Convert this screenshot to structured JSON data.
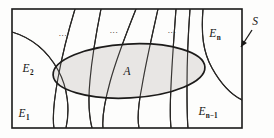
{
  "figure": {
    "caption_alt": "Partition of sample space S into events E1, E2, ..., En-1, En with event A shown as a shaded ellipse overlapping several partition cells",
    "colors": {
      "background": "#fdfdfc",
      "stroke": "#1a1918",
      "ellipse_fill": "#e5e3e1",
      "ellipse_stroke": "#1c1b1a",
      "label_color": "#161514"
    },
    "frame": {
      "x": 12,
      "y": 9,
      "width": 230,
      "height": 119,
      "stroke_width": 1.6
    },
    "ellipse": {
      "cx": 129,
      "cy": 71,
      "rx": 76,
      "ry": 27,
      "rotation_deg": -3,
      "stroke_width": 1.7
    },
    "labels": [
      {
        "id": "label-A",
        "base": "A",
        "sub": "",
        "x": 127,
        "y": 75,
        "size": 11.5
      },
      {
        "id": "label-E1",
        "base": "E",
        "sub": "1",
        "x": 24,
        "y": 117,
        "size": 11.5
      },
      {
        "id": "label-E2",
        "base": "E",
        "sub": "2",
        "x": 28,
        "y": 72,
        "size": 11.5
      },
      {
        "id": "label-En",
        "base": "E",
        "sub": "n",
        "x": 215,
        "y": 37,
        "size": 11.5
      },
      {
        "id": "label-Enm1",
        "base": "E",
        "sub": "n−1",
        "x": 208,
        "y": 115,
        "size": 11.5
      },
      {
        "id": "label-S",
        "base": "S",
        "sub": "",
        "x": 255,
        "y": 25,
        "size": 11.5
      }
    ],
    "ellipses_text": [
      {
        "id": "ellipsis-left",
        "text": "...",
        "x": 63,
        "y": 36,
        "size": 9
      },
      {
        "id": "ellipsis-center",
        "text": "...",
        "x": 114,
        "y": 33,
        "size": 9
      },
      {
        "id": "ellipsis-right",
        "text": "...",
        "x": 172,
        "y": 33,
        "size": 9
      }
    ],
    "pointer": {
      "id": "pointer-S",
      "from_x": 252,
      "from_y": 30,
      "to_x": 241,
      "to_y": 47,
      "stroke_width": 1.3
    },
    "partition_curves": [
      {
        "id": "curve-1",
        "d": "M 12,32 C 32,38 48,52 58,70 C 68,88 70,110 66,128"
      },
      {
        "id": "curve-2",
        "d": "M 75,9 C 68,32 62,56 58,78 C 54,100 52,116 54,128"
      },
      {
        "id": "curve-3",
        "d": "M 101,9 C 96,34 92,58 90,80 C 88,100 89,116 92,128"
      },
      {
        "id": "curve-4",
        "d": "M 136,9 C 126,34 116,60 110,82 C 104,104 102,118 103,128"
      },
      {
        "id": "curve-5",
        "d": "M 158,9 C 152,36 146,62 142,86 C 138,106 137,118 139,128"
      },
      {
        "id": "curve-6",
        "d": "M 176,9 C 174,36 172,62 171,86 C 170,106 170,118 171,128"
      },
      {
        "id": "curve-7",
        "d": "M 190,9 C 188,36 187,62 187,86 C 187,106 187,118 188,128"
      },
      {
        "id": "curve-8",
        "d": "M 203,9 C 201,34 203,52 212,68 C 222,86 234,96 242,100"
      }
    ]
  }
}
